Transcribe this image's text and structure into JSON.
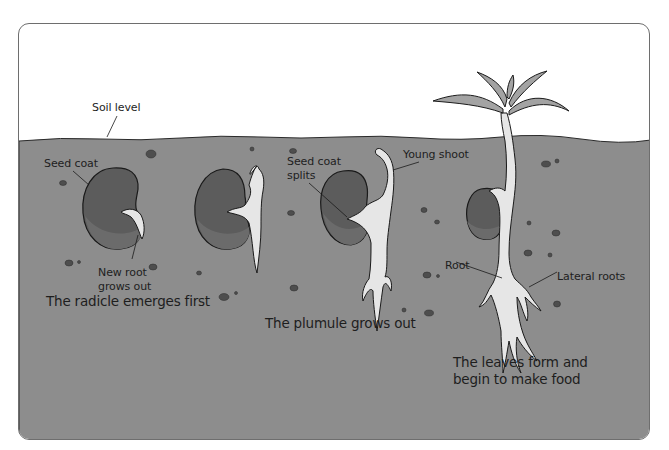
{
  "diagram": {
    "type": "germination-stages",
    "colors": {
      "sky": "#ffffff",
      "soil": "#8d8d8d",
      "seed": "#5c5c5c",
      "seed_shade": "#6b6b6b",
      "root": "#e6e6e6",
      "leaf": "#a3a3a3",
      "outline": "#1a1a1a",
      "stone": "#4e4e4e"
    }
  },
  "labels": {
    "soil_level": "Soil level",
    "seed_coat": "Seed coat",
    "new_root_line1": "New root",
    "new_root_line2": "grows out",
    "seed_coat_splits_line1": "Seed coat",
    "seed_coat_splits_line2": "splits",
    "young_shoot": "Young shoot",
    "root": "Root",
    "lateral_roots": "Lateral roots"
  },
  "captions": {
    "stage1": "The radicle emerges first",
    "stage2": "The plumule grows out",
    "stage3_line1": "The leaves form and",
    "stage3_line2": "begin to make food"
  }
}
